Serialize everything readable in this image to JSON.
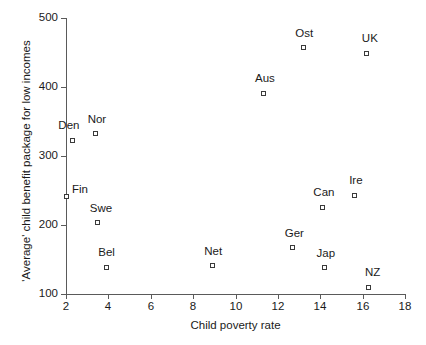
{
  "chart_data": {
    "type": "scatter",
    "title": "",
    "xlabel": "Child poverty rate",
    "ylabel": "'Average' child benefit package for low incomes",
    "xlim": [
      2,
      18
    ],
    "ylim": [
      100,
      500
    ],
    "xticks": [
      2,
      4,
      6,
      8,
      10,
      12,
      14,
      16,
      18
    ],
    "yticks": [
      100,
      200,
      300,
      400,
      500
    ],
    "grid": false,
    "legend": "none",
    "marker_style": "open-square",
    "points": [
      {
        "label": "Den",
        "x": 2.3,
        "y": 323,
        "label_dx": -14,
        "label_dy": -15
      },
      {
        "label": "Nor",
        "x": 3.4,
        "y": 332,
        "label_dx": -8,
        "label_dy": -15
      },
      {
        "label": "Fin",
        "x": 2.0,
        "y": 242,
        "label_dx": 6,
        "label_dy": -7
      },
      {
        "label": "Swe",
        "x": 3.5,
        "y": 203,
        "label_dx": -8,
        "label_dy": -15
      },
      {
        "label": "Bel",
        "x": 3.9,
        "y": 139,
        "label_dx": -8,
        "label_dy": -15
      },
      {
        "label": "Net",
        "x": 8.9,
        "y": 141,
        "label_dx": -8,
        "label_dy": -15
      },
      {
        "label": "Aus",
        "x": 11.3,
        "y": 391,
        "label_dx": -8,
        "label_dy": -15
      },
      {
        "label": "Ger",
        "x": 12.7,
        "y": 167,
        "label_dx": -8,
        "label_dy": -15
      },
      {
        "label": "Ost",
        "x": 13.2,
        "y": 457,
        "label_dx": -8,
        "label_dy": -15
      },
      {
        "label": "Can",
        "x": 14.1,
        "y": 226,
        "label_dx": -9,
        "label_dy": -15
      },
      {
        "label": "Jap",
        "x": 14.2,
        "y": 138,
        "label_dx": -8,
        "label_dy": -15
      },
      {
        "label": "Ire",
        "x": 15.6,
        "y": 243,
        "label_dx": -5,
        "label_dy": -15
      },
      {
        "label": "UK",
        "x": 16.2,
        "y": 449,
        "label_dx": -5,
        "label_dy": -15
      },
      {
        "label": "NZ",
        "x": 16.3,
        "y": 110,
        "label_dx": -4,
        "label_dy": -15
      }
    ]
  }
}
